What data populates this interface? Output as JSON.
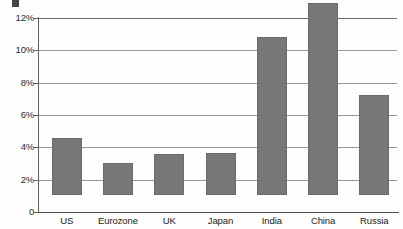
{
  "chart_data": {
    "type": "bar",
    "title": "",
    "xlabel": "",
    "ylabel": "",
    "categories": [
      "US",
      "Eurozone",
      "UK",
      "Japan",
      "India",
      "China",
      "Russia"
    ],
    "values": [
      3.5,
      2.0,
      2.55,
      2.6,
      9.8,
      11.9,
      6.2
    ],
    "value_unit": "%",
    "ylim": [
      0,
      12
    ],
    "ytick_values": [
      0,
      2,
      4,
      6,
      8,
      10,
      12
    ],
    "ytick_labels": [
      "0",
      "2%",
      "4%",
      "6%",
      "8%",
      "10%",
      "12%"
    ],
    "grid": true,
    "grid_axis": "y",
    "legend": false,
    "legend_position": "none",
    "series": [
      {
        "name": "",
        "values": [
          3.5,
          2.0,
          2.55,
          2.6,
          9.8,
          11.9,
          6.2
        ]
      }
    ],
    "bar_color": "#777777",
    "bar_edge_color": "#6a6a6a",
    "gridline_color": "#9a9a9a",
    "axis_color": "#4c4c4c",
    "background_color": "#fdfdfb"
  }
}
